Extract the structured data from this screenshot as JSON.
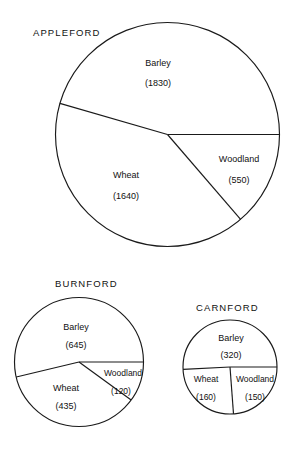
{
  "figure": {
    "background": "#ffffff",
    "stroke_color": "#1a1a1a",
    "text_color": "#111111"
  },
  "chart_data": [
    {
      "type": "pie",
      "title": "APPLEFORD",
      "categories": [
        "Barley",
        "Wheat",
        "Woodland"
      ],
      "values": [
        1830,
        1640,
        550
      ],
      "total": 4020,
      "labels": [
        "(1830)",
        "(1640)",
        "(550)"
      ],
      "start_angle_deg": 0,
      "direction": "counterclockwise",
      "legend": "none",
      "grid": false
    },
    {
      "type": "pie",
      "title": "BURNFORD",
      "categories": [
        "Barley",
        "Wheat",
        "Woodland"
      ],
      "values": [
        645,
        435,
        120
      ],
      "total": 1200,
      "labels": [
        "(645)",
        "(435)",
        "(120)"
      ],
      "start_angle_deg": 0,
      "direction": "counterclockwise",
      "legend": "none",
      "grid": false
    },
    {
      "type": "pie",
      "title": "CARNFORD",
      "categories": [
        "Barley",
        "Wheat",
        "Woodland"
      ],
      "values": [
        320,
        160,
        150
      ],
      "total": 630,
      "labels": [
        "(320)",
        "(160)",
        "(150)"
      ],
      "start_angle_deg": 0,
      "direction": "counterclockwise",
      "legend": "none",
      "grid": false
    }
  ],
  "appleford": {
    "title": "APPLEFORD",
    "barley_label": "Barley",
    "barley_value": "(1830)",
    "wheat_label": "Wheat",
    "wheat_value": "(1640)",
    "woodland_label": "Woodland",
    "woodland_value": "(550)"
  },
  "burnford": {
    "title": "BURNFORD",
    "barley_label": "Barley",
    "barley_value": "(645)",
    "wheat_label": "Wheat",
    "wheat_value": "(435)",
    "woodland_label": "Woodland",
    "woodland_value": "(120)"
  },
  "carnford": {
    "title": "CARNFORD",
    "barley_label": "Barley",
    "barley_value": "(320)",
    "wheat_label": "Wheat",
    "wheat_value": "(160)",
    "woodland_label": "Woodland",
    "woodland_value": "(150)"
  }
}
